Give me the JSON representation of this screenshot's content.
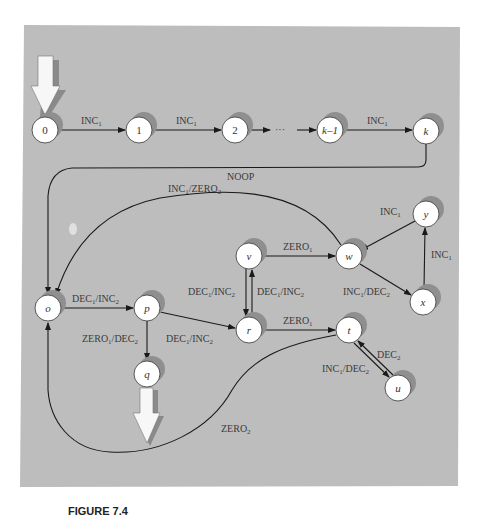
{
  "figure": {
    "background_color": "#bdbdbd",
    "node_fill": "#ffffff",
    "shadow_color": "#8f8f8f",
    "edge_color": "#1a1a1a",
    "caption_label": "FIGURE 7.4",
    "caption_text": "A program machine (partially cut off)"
  },
  "nodes": [
    {
      "id": "0",
      "label": "0"
    },
    {
      "id": "1",
      "label": "1"
    },
    {
      "id": "2",
      "label": "2"
    },
    {
      "id": "k-1",
      "label": "k–1"
    },
    {
      "id": "k",
      "label": "k"
    },
    {
      "id": "o",
      "label": "o"
    },
    {
      "id": "p",
      "label": "p"
    },
    {
      "id": "q",
      "label": "q"
    },
    {
      "id": "r",
      "label": "r"
    },
    {
      "id": "t",
      "label": "t"
    },
    {
      "id": "u",
      "label": "u"
    },
    {
      "id": "v",
      "label": "v"
    },
    {
      "id": "w",
      "label": "w"
    },
    {
      "id": "x",
      "label": "x"
    },
    {
      "id": "y",
      "label": "y"
    }
  ],
  "edges": [
    {
      "from": "0",
      "to": "1",
      "op": "INC",
      "sub": "1"
    },
    {
      "from": "1",
      "to": "2",
      "op": "INC",
      "sub": "1"
    },
    {
      "from": "2",
      "to": "k-1",
      "op": "···",
      "sub": ""
    },
    {
      "from": "k-1",
      "to": "k",
      "op": "INC",
      "sub": "1"
    },
    {
      "from": "k",
      "to": "o",
      "op": "NOOP",
      "sub": ""
    },
    {
      "from": "w",
      "to": "o",
      "op": "INC",
      "sub": "1",
      "op2": "ZERO",
      "sub2": "2"
    },
    {
      "from": "o",
      "to": "p",
      "op": "DEC",
      "sub": "1",
      "op2": "INC",
      "sub2": "2"
    },
    {
      "from": "p",
      "to": "q",
      "op": "ZERO",
      "sub": "1",
      "op2": "DEC",
      "sub2": "2"
    },
    {
      "from": "p",
      "to": "r",
      "op": "DEC",
      "sub": "1",
      "op2": "INC",
      "sub2": "2"
    },
    {
      "from": "v",
      "to": "r",
      "op": "DEC",
      "sub": "1",
      "op2": "INC",
      "sub2": "2"
    },
    {
      "from": "r",
      "to": "v",
      "op": "DEC",
      "sub": "1",
      "op2": "INC",
      "sub2": "2"
    },
    {
      "from": "v",
      "to": "w",
      "op": "ZERO",
      "sub": "1"
    },
    {
      "from": "r",
      "to": "t",
      "op": "ZERO",
      "sub": "1"
    },
    {
      "from": "y",
      "to": "w",
      "op": "INC",
      "sub": "1"
    },
    {
      "from": "x",
      "to": "y",
      "op": "INC",
      "sub": "1"
    },
    {
      "from": "w",
      "to": "x",
      "op": "INC",
      "sub": "1",
      "op2": "DEC",
      "sub2": "2"
    },
    {
      "from": "u",
      "to": "t",
      "op": "DEC",
      "sub": "2"
    },
    {
      "from": "t",
      "to": "u",
      "op": "INC",
      "sub": "1",
      "op2": "DEC",
      "sub2": "2"
    },
    {
      "from": "t",
      "to": "o",
      "op": "ZERO",
      "sub": "2"
    }
  ],
  "start_arrow": {
    "target": "0"
  },
  "halt_arrow": {
    "source": "q"
  }
}
